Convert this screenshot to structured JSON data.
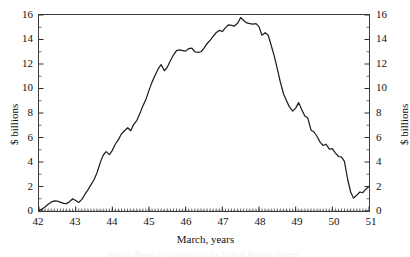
{
  "figure": {
    "background_color": "#ffffff",
    "line_color": "#1f1f1f",
    "frame_color": "#3a3a3a",
    "caption_faint": "Source: Board of Governors of the Federal Reserve System"
  },
  "axes": {
    "y_left_title": "$ billions",
    "y_right_title": "$ billions",
    "x_title": "March, years",
    "y_ticks": [
      0,
      2,
      4,
      6,
      8,
      10,
      12,
      14,
      16
    ],
    "y_tick_labels": [
      "0",
      "2",
      "4",
      "6",
      "8",
      "10",
      "12",
      "14",
      "16"
    ],
    "x_ticks": [
      42,
      43,
      44,
      45,
      46,
      47,
      48,
      49,
      50,
      51
    ],
    "x_tick_labels": [
      "42",
      "43",
      "44",
      "45",
      "46",
      "47",
      "48",
      "49",
      "50",
      "51"
    ],
    "x_minor_ticks_per_interval": 12
  },
  "chart_data": {
    "type": "line",
    "title": "",
    "subtitle": "",
    "xlabel": "March, years",
    "ylabel": "$ billions",
    "y2label": "$ billions",
    "xlim": [
      42,
      51
    ],
    "ylim": [
      0,
      16
    ],
    "grid": false,
    "legend": null,
    "x_unit": "year (March of 19xx), monthly observations",
    "y_unit": "billions of dollars",
    "series": [
      {
        "name": "$ billions",
        "color": "#1f1f1f",
        "x": [
          42.0,
          42.08,
          42.17,
          42.25,
          42.33,
          42.42,
          42.5,
          42.58,
          42.67,
          42.75,
          42.83,
          42.92,
          43.0,
          43.08,
          43.17,
          43.25,
          43.33,
          43.42,
          43.5,
          43.58,
          43.67,
          43.75,
          43.83,
          43.92,
          44.0,
          44.08,
          44.17,
          44.25,
          44.33,
          44.42,
          44.5,
          44.58,
          44.67,
          44.75,
          44.83,
          44.92,
          45.0,
          45.08,
          45.17,
          45.25,
          45.33,
          45.42,
          45.5,
          45.58,
          45.67,
          45.75,
          45.83,
          45.92,
          46.0,
          46.08,
          46.17,
          46.25,
          46.33,
          46.42,
          46.5,
          46.58,
          46.67,
          46.75,
          46.83,
          46.92,
          47.0,
          47.08,
          47.17,
          47.25,
          47.33,
          47.42,
          47.5,
          47.58,
          47.67,
          47.75,
          47.83,
          47.92,
          48.0,
          48.08,
          48.17,
          48.25,
          48.33,
          48.42,
          48.5,
          48.58,
          48.67,
          48.75,
          48.83,
          48.92,
          49.0,
          49.08,
          49.17,
          49.25,
          49.33,
          49.42,
          49.5,
          49.58,
          49.67,
          49.75,
          49.83,
          49.92,
          50.0,
          50.08,
          50.17,
          50.25,
          50.33,
          50.42,
          50.5,
          50.58,
          50.67,
          50.75,
          50.83,
          50.92,
          51.0
        ],
        "y": [
          0.05,
          0.15,
          0.35,
          0.55,
          0.72,
          0.82,
          0.8,
          0.72,
          0.62,
          0.6,
          0.75,
          1.0,
          0.85,
          0.7,
          0.95,
          1.35,
          1.7,
          2.15,
          2.55,
          3.1,
          3.95,
          4.55,
          4.85,
          4.6,
          4.95,
          5.45,
          5.85,
          6.3,
          6.55,
          6.8,
          6.55,
          7.05,
          7.4,
          7.95,
          8.55,
          9.15,
          9.85,
          10.5,
          11.1,
          11.6,
          11.95,
          11.45,
          11.75,
          12.25,
          12.75,
          13.1,
          13.15,
          13.1,
          13.05,
          13.25,
          13.3,
          13.0,
          12.95,
          13.0,
          13.3,
          13.65,
          13.95,
          14.25,
          14.55,
          14.75,
          14.65,
          14.95,
          15.2,
          15.15,
          15.1,
          15.35,
          15.8,
          15.55,
          15.35,
          15.3,
          15.25,
          15.3,
          15.05,
          14.35,
          14.55,
          14.35,
          13.55,
          12.6,
          11.6,
          10.55,
          9.55,
          9.0,
          8.5,
          8.15,
          8.4,
          8.85,
          8.25,
          7.75,
          7.6,
          6.6,
          6.45,
          6.1,
          5.6,
          5.35,
          5.45,
          5.05,
          5.1,
          4.75,
          4.45,
          4.05,
          3.85,
          4.35,
          4.15,
          4.45,
          5.0,
          4.35,
          4.3,
          4.45,
          4.4
        ]
      }
    ],
    "baseline_series": {
      "name": "zero baseline (dotted)",
      "description": "dotted line running along y = 0 across the full x range",
      "value": 0.0,
      "style": "dotted"
    },
    "annotations": [
      {
        "text": "peak",
        "x": 46.5,
        "y": 15.8
      },
      {
        "text": "trough",
        "x": 50.58,
        "y": 1.0
      }
    ],
    "tail": {
      "comment": "values after 50.25 descend to a trough then recover",
      "x": [
        50.25,
        50.33,
        50.42,
        50.5,
        50.58,
        50.67,
        50.75,
        50.83,
        50.92,
        51.0
      ],
      "y": [
        4.4,
        4.05,
        2.55,
        1.55,
        1.05,
        1.3,
        1.55,
        1.5,
        1.8,
        2.0
      ]
    }
  }
}
